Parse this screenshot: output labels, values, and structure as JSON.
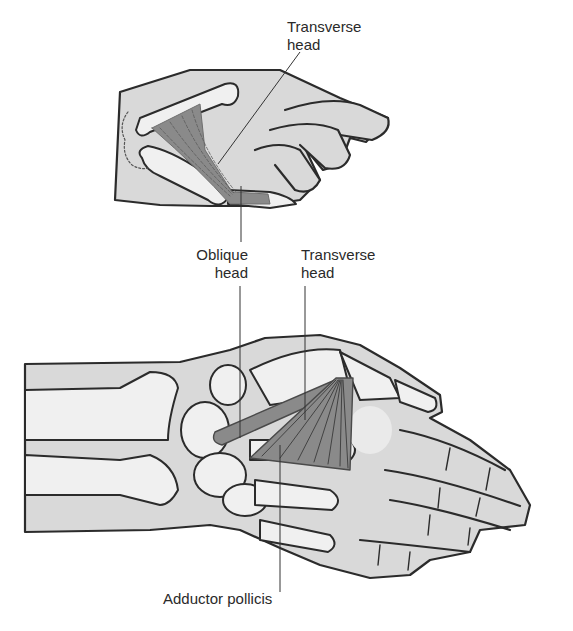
{
  "figure": {
    "colors": {
      "skin": "#d9d9d9",
      "bone": "#f0f0f0",
      "outline": "#2b2b2b",
      "muscle": "#8a8a8a",
      "muscle_dark": "#6e6e6e",
      "leader": "#333333",
      "background": "#ffffff"
    },
    "top_view": {
      "label_transverse": {
        "line1": "Transverse",
        "line2": "head"
      }
    },
    "bottom_view": {
      "label_oblique": {
        "line1": "Oblique",
        "line2": "head"
      },
      "label_transverse": {
        "line1": "Transverse",
        "line2": "head"
      },
      "label_muscle": "Adductor pollicis"
    }
  }
}
